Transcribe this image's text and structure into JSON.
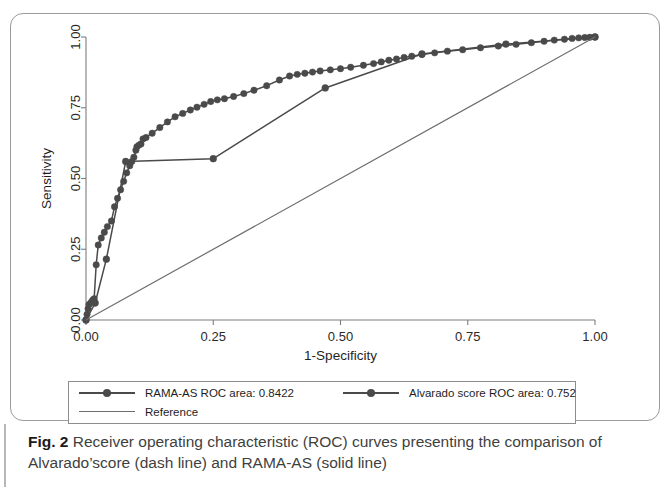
{
  "figure": {
    "number_label": "Fig. 2",
    "caption_text": "Receiver operating characteristic (ROC) curves presenting the comparison of Alvarado’score (dash line) and RAMA-AS (solid line)"
  },
  "legend": {
    "entries": [
      {
        "label": "RAMA-AS ROC area: 0.8422",
        "style": "line-marker",
        "color": "#4a4a4a"
      },
      {
        "label": "Alvarado score ROC area: 0.752",
        "style": "line-marker",
        "color": "#4a4a4a"
      },
      {
        "label": "Reference",
        "style": "line",
        "color": "#6e6e6e"
      }
    ]
  },
  "chart_data": {
    "type": "line",
    "title": "",
    "xlabel": "1-Specificity",
    "ylabel": "Sensitivity",
    "xlim": [
      0.0,
      1.0
    ],
    "ylim": [
      0.0,
      1.0
    ],
    "xticks": [
      0.0,
      0.25,
      0.5,
      0.75,
      1.0
    ],
    "xticklabels": [
      "0.00",
      "0.25",
      "0.50",
      "0.75",
      "1.00"
    ],
    "yticks": [
      0.0,
      0.25,
      0.5,
      0.75,
      1.0
    ],
    "yticklabels": [
      "0.00",
      "0.25",
      "0.50",
      "0.75",
      "1.00"
    ],
    "grid": false,
    "legend_position": "below-axes",
    "series": [
      {
        "name": "RAMA-AS ROC area: 0.8422",
        "auc": 0.8422,
        "color": "#4a4a4a",
        "markers": true,
        "x": [
          0.0,
          0.002,
          0.004,
          0.006,
          0.01,
          0.013,
          0.016,
          0.02,
          0.024,
          0.03,
          0.036,
          0.042,
          0.05,
          0.056,
          0.062,
          0.068,
          0.074,
          0.08,
          0.086,
          0.09,
          0.094,
          0.098,
          0.1,
          0.104,
          0.108,
          0.112,
          0.118,
          0.13,
          0.145,
          0.16,
          0.175,
          0.19,
          0.205,
          0.218,
          0.232,
          0.245,
          0.258,
          0.272,
          0.29,
          0.31,
          0.33,
          0.355,
          0.38,
          0.4,
          0.415,
          0.43,
          0.445,
          0.46,
          0.48,
          0.5,
          0.52,
          0.545,
          0.565,
          0.58,
          0.595,
          0.61,
          0.625,
          0.64,
          0.66,
          0.685,
          0.71,
          0.74,
          0.775,
          0.81,
          0.845,
          0.875,
          0.9,
          0.92,
          0.94,
          0.955,
          0.968,
          0.98,
          0.99,
          1.0
        ],
        "y": [
          0.0,
          0.02,
          0.04,
          0.055,
          0.062,
          0.07,
          0.075,
          0.195,
          0.265,
          0.29,
          0.31,
          0.33,
          0.35,
          0.4,
          0.43,
          0.46,
          0.49,
          0.52,
          0.545,
          0.56,
          0.575,
          0.6,
          0.612,
          0.618,
          0.622,
          0.64,
          0.645,
          0.66,
          0.68,
          0.7,
          0.718,
          0.73,
          0.742,
          0.752,
          0.762,
          0.772,
          0.778,
          0.782,
          0.79,
          0.8,
          0.812,
          0.828,
          0.848,
          0.862,
          0.868,
          0.872,
          0.876,
          0.88,
          0.884,
          0.888,
          0.893,
          0.9,
          0.906,
          0.912,
          0.918,
          0.922,
          0.928,
          0.932,
          0.938,
          0.944,
          0.95,
          0.955,
          0.962,
          0.968,
          0.974,
          0.98,
          0.985,
          0.989,
          0.992,
          0.995,
          0.997,
          0.998,
          0.999,
          1.0
        ]
      },
      {
        "name": "Alvarado score ROC area: 0.752",
        "auc": 0.752,
        "color": "#4a4a4a",
        "markers": true,
        "x": [
          0.0,
          0.018,
          0.04,
          0.078,
          0.25,
          0.47,
          0.66,
          0.825,
          1.0
        ],
        "y": [
          0.0,
          0.06,
          0.215,
          0.56,
          0.57,
          0.82,
          0.94,
          0.975,
          1.0
        ]
      },
      {
        "name": "Reference",
        "color": "#6e6e6e",
        "markers": false,
        "x": [
          0.0,
          1.0
        ],
        "y": [
          0.0,
          1.0
        ]
      }
    ]
  }
}
